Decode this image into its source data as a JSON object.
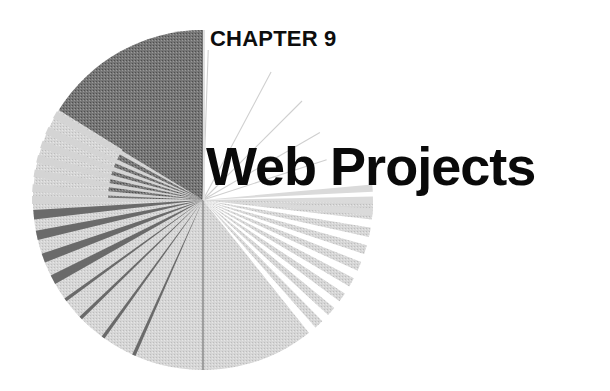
{
  "page": {
    "chapter_label": "CHAPTER 9",
    "chapter_title": "Web Projects"
  },
  "decoration": {
    "type": "radial-burst-quarter-circles",
    "center": [
      203,
      200
    ],
    "radius": 170,
    "colors": {
      "dark_wedge": "#6e6e6e",
      "light_fill": "#d2d2d2",
      "ray_dark": "#6a6a6a",
      "ray_light": "#dcdcdc",
      "faint_line": "#c8c8c8",
      "background": "#ffffff",
      "text": "#0d0d0d"
    },
    "dark_rays_lower_left_deg": [
      185,
      192,
      200,
      208,
      216,
      224,
      234,
      246
    ],
    "light_rays_upper_left_deg": [
      150,
      156,
      161,
      166,
      171,
      176,
      180
    ],
    "white_rays_lower_right_deg": [
      -8,
      -14,
      -20,
      -26,
      -32,
      -38,
      -44,
      -50
    ],
    "light_rays_right_deg": [
      4,
      0,
      -4
    ],
    "faint_lines_upper_right_deg": [
      88,
      62,
      45,
      30,
      18
    ]
  }
}
